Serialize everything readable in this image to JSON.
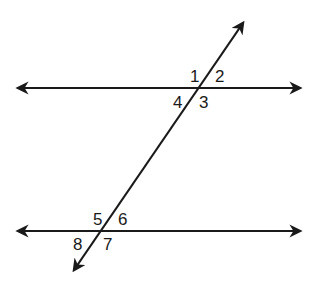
{
  "diagram": {
    "colors": {
      "stroke": "#1a1a1a",
      "background": "#ffffff"
    },
    "top_intersection_angles": [
      "1",
      "2",
      "3",
      "4"
    ],
    "bottom_intersection_angles": [
      "5",
      "6",
      "7",
      "8"
    ]
  }
}
